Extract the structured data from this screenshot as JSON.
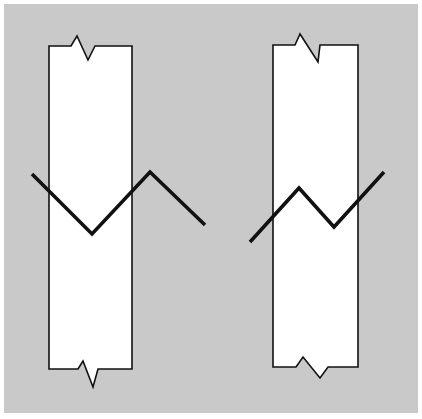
{
  "figure": {
    "type": "illusion-diagram",
    "colors": {
      "background": "#c9c9c9",
      "bar_fill": "#ffffff",
      "stroke": "#111111",
      "page": "#ffffff"
    },
    "bars": [
      {
        "name": "left-bar",
        "outline": "49,142 49,46 71,46 77,36 88,60 95,46 132,46 132,369 98,369 93,387 83,361 78,369 49,369 49,142"
      },
      {
        "name": "right-bar",
        "outline": "273,45 295,45 300,34 318,62 320,45 358,45 358,367 328,367 320,378 303,357 296,367 273,367 273,45"
      }
    ],
    "zigzags": [
      {
        "name": "left-zigzag",
        "points": "32,174 92,234 150,172 205,225"
      },
      {
        "name": "right-zigzag",
        "points": "250,242 299,188 334,227 384,172"
      }
    ]
  }
}
